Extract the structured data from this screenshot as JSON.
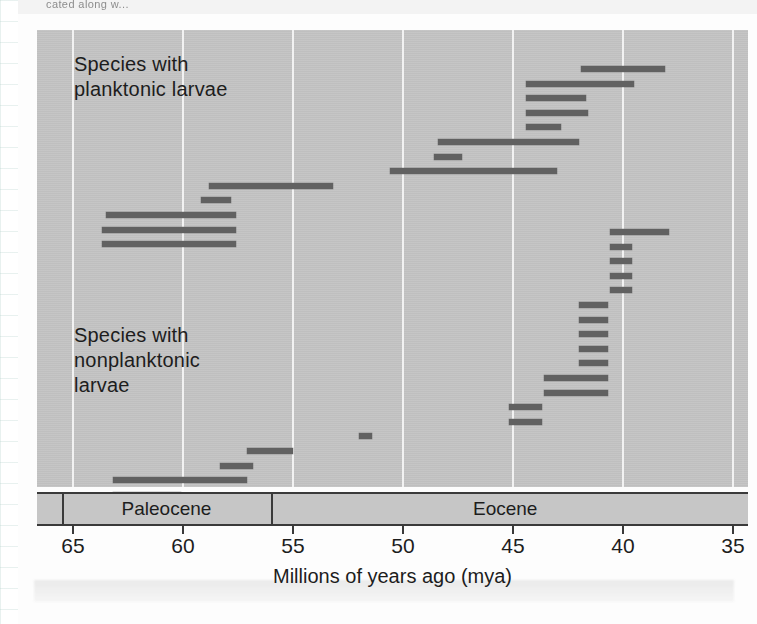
{
  "figure": {
    "bleed_text_top": "cated along w...",
    "background_color": "#c3c3c3",
    "bar_color": "#616161",
    "gridline_color": "#f2f2f2",
    "axis_color": "#3a3a3a"
  },
  "axis": {
    "title": "Millions of years ago (mya)",
    "ticks": [
      65,
      60,
      55,
      50,
      45,
      40,
      35
    ],
    "tick_labels": [
      "65",
      "60",
      "55",
      "50",
      "45",
      "40",
      "35"
    ],
    "min": 35,
    "max": 66.6,
    "direction": "reversed"
  },
  "epochs": [
    {
      "name": "Paleocene",
      "start": 65.5,
      "end": 56.0
    },
    {
      "name": "Eocene",
      "start": 56.0,
      "end": 34.8
    }
  ],
  "groups": [
    {
      "id": "planktonic",
      "label": "Species with\nplanktonic larvae"
    },
    {
      "id": "nonplanktonic",
      "label": "Species with\nnonplanktonic\nlarvae"
    }
  ],
  "chart_data": {
    "type": "bar",
    "orientation": "horizontal",
    "title": "",
    "subtitle": "",
    "xlabel": "Millions of years ago (mya)",
    "ylabel": "",
    "xlim": [
      66.6,
      34.8
    ],
    "x_reversed": true,
    "grid": "vertical",
    "legend": "none",
    "value_unit": "mya",
    "note": "Each bar is one species' stratigraphic range (first to last occurrence), drawn from its older start age to its younger end age.",
    "series": [
      {
        "name": "Species with planktonic larvae",
        "group": "planktonic",
        "bars": [
          {
            "row": 1,
            "start": 41.9,
            "end": 38.1
          },
          {
            "row": 2,
            "start": 44.4,
            "end": 39.5
          },
          {
            "row": 3,
            "start": 44.4,
            "end": 41.7
          },
          {
            "row": 4,
            "start": 44.4,
            "end": 41.6
          },
          {
            "row": 5,
            "start": 44.4,
            "end": 42.8
          },
          {
            "row": 6,
            "start": 48.4,
            "end": 42.0
          },
          {
            "row": 7,
            "start": 48.6,
            "end": 47.3
          },
          {
            "row": 8,
            "start": 50.6,
            "end": 43.0
          },
          {
            "row": 9,
            "start": 58.8,
            "end": 53.2
          },
          {
            "row": 10,
            "start": 59.2,
            "end": 57.8
          },
          {
            "row": 11,
            "start": 63.5,
            "end": 57.6
          },
          {
            "row": 12,
            "start": 63.7,
            "end": 57.6
          },
          {
            "row": 13,
            "start": 63.7,
            "end": 57.6
          }
        ]
      },
      {
        "name": "Species with nonplanktonic larvae",
        "group": "nonplanktonic",
        "bars": [
          {
            "row": 1,
            "start": 40.6,
            "end": 37.9
          },
          {
            "row": 2,
            "start": 40.6,
            "end": 39.6
          },
          {
            "row": 3,
            "start": 40.6,
            "end": 39.6
          },
          {
            "row": 4,
            "start": 40.6,
            "end": 39.6
          },
          {
            "row": 5,
            "start": 40.6,
            "end": 39.6
          },
          {
            "row": 6,
            "start": 42.0,
            "end": 40.7
          },
          {
            "row": 7,
            "start": 42.0,
            "end": 40.7
          },
          {
            "row": 8,
            "start": 42.0,
            "end": 40.7
          },
          {
            "row": 9,
            "start": 42.0,
            "end": 40.7
          },
          {
            "row": 10,
            "start": 42.0,
            "end": 40.7
          },
          {
            "row": 11,
            "start": 43.6,
            "end": 40.7
          },
          {
            "row": 12,
            "start": 43.6,
            "end": 40.7
          },
          {
            "row": 13,
            "start": 45.2,
            "end": 43.7
          },
          {
            "row": 14,
            "start": 45.2,
            "end": 43.7
          },
          {
            "row": 15,
            "start": 52.0,
            "end": 51.4
          },
          {
            "row": 16,
            "start": 57.1,
            "end": 55.0
          },
          {
            "row": 17,
            "start": 58.3,
            "end": 56.8
          },
          {
            "row": 18,
            "start": 63.2,
            "end": 57.1
          },
          {
            "row": 19,
            "start": 63.2,
            "end": 60.1
          },
          {
            "row": 20,
            "start": 63.2,
            "end": 60.1
          }
        ]
      }
    ]
  }
}
